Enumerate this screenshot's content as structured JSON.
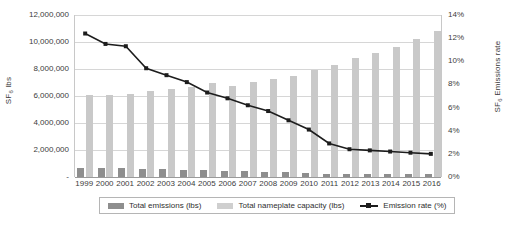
{
  "chart_data": {
    "type": "bar",
    "title": "",
    "xlabel": "",
    "ylabel": "SF6 lbs",
    "y2label": "SF6 Emissions rate",
    "categories": [
      "1999",
      "2000",
      "2001",
      "2002",
      "2003",
      "2004",
      "2005",
      "2006",
      "2007",
      "2008",
      "2009",
      "2010",
      "2011",
      "2012",
      "2013",
      "2014",
      "2015",
      "2016"
    ],
    "ylim": [
      0,
      12000000
    ],
    "y2lim": [
      0,
      0.14
    ],
    "grid": true,
    "legend_position": "bottom",
    "y_ticks": [
      "-",
      "2,000,000",
      "4,000,000",
      "6,000,000",
      "8,000,000",
      "10,000,000",
      "12,000,000"
    ],
    "y2_ticks": [
      "0%",
      "2%",
      "4%",
      "6%",
      "8%",
      "10%",
      "12%",
      "14%"
    ],
    "series": [
      {
        "name": "Total emissions (lbs)",
        "type": "bar",
        "axis": "left",
        "color": "#8e8e8e",
        "values": [
          700000,
          660000,
          640000,
          600000,
          560000,
          540000,
          520000,
          440000,
          420000,
          380000,
          350000,
          300000,
          250000,
          230000,
          220000,
          210000,
          205000,
          200000
        ]
      },
      {
        "name": "Total nameplate capacity (lbs)",
        "type": "bar",
        "axis": "left",
        "color": "#c9c9c9",
        "values": [
          6050000,
          6100000,
          6150000,
          6400000,
          6550000,
          6700000,
          6950000,
          6750000,
          7050000,
          7250000,
          7500000,
          7900000,
          8300000,
          8800000,
          9200000,
          9600000,
          10200000,
          10800000
        ]
      },
      {
        "name": "Emission rate (%)",
        "type": "line",
        "axis": "right",
        "color": "#1d1d1d",
        "values": [
          0.124,
          0.115,
          0.113,
          0.094,
          0.088,
          0.082,
          0.073,
          0.068,
          0.062,
          0.057,
          0.049,
          0.041,
          0.029,
          0.024,
          0.023,
          0.022,
          0.021,
          0.02
        ]
      }
    ]
  },
  "legend": {
    "items": [
      {
        "label": "Total emissions (lbs)"
      },
      {
        "label": "Total nameplate capacity (lbs)"
      },
      {
        "label": "Emission rate (%)"
      }
    ]
  }
}
